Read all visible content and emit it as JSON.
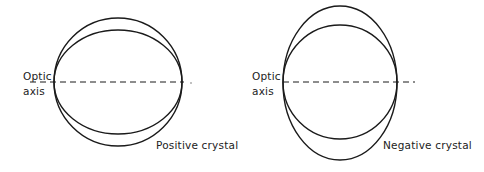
{
  "panels": [
    {
      "name": "positive",
      "axis_label_line1": "Optic",
      "axis_label_line2": "axis",
      "caption": "Positive crystal",
      "circle": {
        "cx": 118,
        "cy": 82,
        "r": 64
      },
      "ellipse": {
        "cx": 118,
        "cy": 82,
        "rx": 64,
        "ry": 52
      },
      "axis": {
        "x1": 30,
        "x2": 184,
        "y": 82
      }
    },
    {
      "name": "negative",
      "axis_label_line1": "Optic",
      "axis_label_line2": "axis",
      "caption": "Negative crystal",
      "circle": {
        "cx": 340,
        "cy": 82,
        "r": 57
      },
      "ellipse": {
        "cx": 340,
        "cy": 83,
        "rx": 57,
        "ry": 77
      },
      "axis": {
        "x1": 283,
        "x2": 415,
        "y": 82
      }
    }
  ],
  "colors": {
    "stroke": "#1a1a1a",
    "background": "#ffffff"
  }
}
